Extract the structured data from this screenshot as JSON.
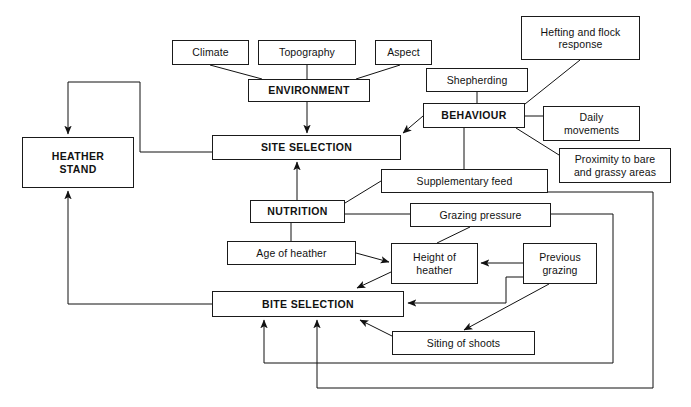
{
  "diagram": {
    "type": "flow-diagram",
    "caption": "",
    "nodes": [
      {
        "id": "climate",
        "label": "Climate",
        "style": "plain",
        "x": 172,
        "y": 40,
        "w": 77,
        "h": 25
      },
      {
        "id": "topography",
        "label": "Topography",
        "style": "plain",
        "x": 258,
        "y": 40,
        "w": 98,
        "h": 25
      },
      {
        "id": "aspect",
        "label": "Aspect",
        "style": "plain",
        "x": 375,
        "y": 40,
        "w": 57,
        "h": 25
      },
      {
        "id": "hefting",
        "label": "Hefting and flock\nresponse",
        "style": "plain",
        "x": 521,
        "y": 16,
        "w": 119,
        "h": 44
      },
      {
        "id": "shepherding",
        "label": "Shepherding",
        "style": "plain",
        "x": 426,
        "y": 68,
        "w": 102,
        "h": 24
      },
      {
        "id": "environment",
        "label": "ENVIRONMENT",
        "style": "primary",
        "x": 248,
        "y": 79,
        "w": 122,
        "h": 23
      },
      {
        "id": "behaviour",
        "label": "BEHAVIOUR",
        "style": "primary",
        "x": 423,
        "y": 103,
        "w": 102,
        "h": 25
      },
      {
        "id": "daily",
        "label": "Daily\nmovements",
        "style": "plain",
        "x": 543,
        "y": 106,
        "w": 97,
        "h": 35
      },
      {
        "id": "site",
        "label": "SITE SELECTION",
        "style": "primary",
        "x": 212,
        "y": 135,
        "w": 189,
        "h": 25
      },
      {
        "id": "heather-stand",
        "label": "HEATHER\nSTAND",
        "style": "primary",
        "x": 22,
        "y": 137,
        "w": 112,
        "h": 51
      },
      {
        "id": "proximity",
        "label": "Proximity to bare\nand grassy areas",
        "style": "plain",
        "x": 559,
        "y": 148,
        "w": 112,
        "h": 35
      },
      {
        "id": "supplementary",
        "label": "Supplementary feed",
        "style": "plain",
        "x": 381,
        "y": 169,
        "w": 167,
        "h": 24
      },
      {
        "id": "nutrition",
        "label": "NUTRITION",
        "style": "primary",
        "x": 250,
        "y": 200,
        "w": 95,
        "h": 23
      },
      {
        "id": "grazing-press",
        "label": "Grazing pressure",
        "style": "plain",
        "x": 410,
        "y": 203,
        "w": 141,
        "h": 24
      },
      {
        "id": "age-heather",
        "label": "Age of heather",
        "style": "plain",
        "x": 227,
        "y": 241,
        "w": 129,
        "h": 24
      },
      {
        "id": "height-heather",
        "label": "Height of\nheather",
        "style": "plain",
        "x": 391,
        "y": 243,
        "w": 87,
        "h": 41
      },
      {
        "id": "prev-grazing",
        "label": "Previous\ngrazing",
        "style": "plain",
        "x": 523,
        "y": 243,
        "w": 74,
        "h": 41
      },
      {
        "id": "bite",
        "label": "BITE SELECTION",
        "style": "primary",
        "x": 212,
        "y": 291,
        "w": 192,
        "h": 26
      },
      {
        "id": "siting",
        "label": "Siting of shoots",
        "style": "plain",
        "x": 392,
        "y": 331,
        "w": 143,
        "h": 24
      }
    ],
    "frames": [
      {
        "id": "outer-return-frame",
        "x": 0,
        "y": 0,
        "w": 691,
        "h": 407
      }
    ],
    "edges": [
      {
        "id": "climate-to-environment",
        "from": "climate",
        "to": "environment",
        "arrow": false
      },
      {
        "id": "topography-to-environment",
        "from": "topography",
        "to": "environment",
        "arrow": false
      },
      {
        "id": "aspect-to-environment",
        "from": "aspect",
        "to": "environment",
        "arrow": false
      },
      {
        "id": "environment-to-site",
        "from": "environment",
        "to": "site",
        "arrow": true
      },
      {
        "id": "shepherding-to-behaviour",
        "from": "shepherding",
        "to": "behaviour",
        "arrow": false
      },
      {
        "id": "hefting-to-behaviour",
        "from": "hefting",
        "to": "behaviour",
        "arrow": false
      },
      {
        "id": "behaviour-to-daily",
        "from": "behaviour",
        "to": "daily",
        "arrow": false
      },
      {
        "id": "behaviour-to-proximity",
        "from": "behaviour",
        "to": "proximity",
        "arrow": false
      },
      {
        "id": "behaviour-to-site",
        "from": "behaviour",
        "to": "site",
        "arrow": true
      },
      {
        "id": "behaviour-to-supplementary",
        "from": "behaviour",
        "to": "supplementary",
        "arrow": false
      },
      {
        "id": "nutrition-to-site",
        "from": "nutrition",
        "to": "site",
        "arrow": true
      },
      {
        "id": "nutrition-to-supplementary",
        "from": "nutrition",
        "to": "supplementary",
        "arrow": false
      },
      {
        "id": "nutrition-to-grazing",
        "from": "nutrition",
        "to": "grazing-press",
        "arrow": false
      },
      {
        "id": "nutrition-to-age",
        "from": "nutrition",
        "to": "age-heather",
        "arrow": false
      },
      {
        "id": "age-to-height",
        "from": "age-heather",
        "to": "height-heather",
        "arrow": true
      },
      {
        "id": "grazing-to-height",
        "from": "grazing-press",
        "to": "height-heather",
        "arrow": false
      },
      {
        "id": "prev-to-height",
        "from": "prev-grazing",
        "to": "height-heather",
        "arrow": true
      },
      {
        "id": "height-to-bite",
        "from": "height-heather",
        "to": "bite",
        "arrow": true
      },
      {
        "id": "prev-to-bite",
        "from": "prev-grazing",
        "to": "bite",
        "arrow": true
      },
      {
        "id": "prev-to-siting",
        "from": "prev-grazing",
        "to": "siting",
        "arrow": true
      },
      {
        "id": "siting-to-bite",
        "from": "siting",
        "to": "bite",
        "arrow": true
      },
      {
        "id": "site-to-heather-stand",
        "from": "site",
        "to": "heather-stand",
        "arrow": true
      },
      {
        "id": "bite-to-heather-stand",
        "from": "bite",
        "to": "heather-stand",
        "arrow": true
      },
      {
        "id": "grazing-return-to-bite",
        "from": "grazing-press",
        "to": "bite",
        "arrow": true
      },
      {
        "id": "supplementary-return-to-bite",
        "from": "supplementary",
        "to": "bite",
        "arrow": true
      }
    ]
  }
}
